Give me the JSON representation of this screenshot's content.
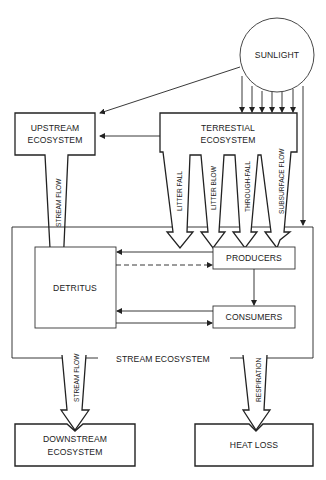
{
  "diagram": {
    "nodes": {
      "sunlight": "SUNLIGHT",
      "upstream_line1": "UPSTREAM",
      "upstream_line2": "ECOSYSTEM",
      "terrestrial_line1": "TERRESTIAL",
      "terrestrial_line2": "ECOSYSTEM",
      "detritus": "DETRITUS",
      "producers": "PRODUCERS",
      "consumers": "CONSUMERS",
      "stream_ecosystem": "STREAM ECOSYSTEM",
      "downstream_line1": "DOWNSTREAM",
      "downstream_line2": "ECOSYSTEM",
      "heat_loss": "HEAT LOSS"
    },
    "flows": {
      "upstream_stream_flow": "STREAM FLOW",
      "litter_fall": "LITTER FALL",
      "litter_blow": "LITTER BLOW",
      "through_fall": "THROUGH-FALL",
      "subsurface_flow": "SUBSURFACE FLOW",
      "downstream_stream_flow": "STREAM FLOW",
      "respiration": "RESPIRATION"
    },
    "colors": {
      "stroke": "#222222",
      "background": "#ffffff"
    }
  }
}
